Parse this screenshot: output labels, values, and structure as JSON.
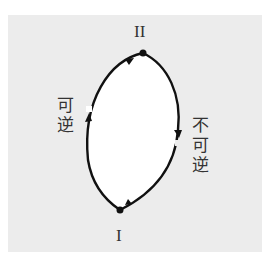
{
  "diagram": {
    "states": [
      {
        "id": "I",
        "label": "I"
      },
      {
        "id": "II",
        "label": "II"
      }
    ],
    "paths": [
      {
        "from": "I",
        "to": "II",
        "side": "left",
        "label_chars": [
          "可",
          "逆"
        ],
        "label": "可逆"
      },
      {
        "from": "II",
        "to": "I",
        "side": "right",
        "label_chars": [
          "不",
          "可",
          "逆"
        ],
        "label": "不可逆"
      }
    ],
    "colors": {
      "panel": "#ececec",
      "line": "#111111",
      "text": "#333333"
    }
  }
}
